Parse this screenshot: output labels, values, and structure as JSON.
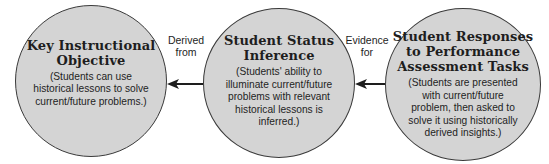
{
  "diagram": {
    "nodes": [
      {
        "id": "key-instructional-objective",
        "title": "Key Instructional Objective",
        "title_lines": [
          "Key Instructional",
          "Objective"
        ],
        "description_lines": [
          "(Students can use",
          "historical lessons to solve",
          "current/future problems.)"
        ]
      },
      {
        "id": "student-status-inference",
        "title": "Student Status Inference",
        "title_lines": [
          "Student Status",
          "Inference"
        ],
        "description_lines": [
          "(Students' ability to",
          "illuminate current/future",
          "problems with relevant",
          "historical lessons is",
          "inferred.)"
        ]
      },
      {
        "id": "student-responses",
        "title": "Student Responses to Performance Assessment Tasks",
        "title_lines": [
          "Student Responses",
          "to Performance",
          "Assessment Tasks"
        ],
        "description_lines": [
          "(Students are presented",
          "with current/future",
          "problem, then asked to",
          "solve it using historically",
          "derived insights.)"
        ]
      }
    ],
    "edges": [
      {
        "from": "student-status-inference",
        "to": "key-instructional-objective",
        "label_lines": [
          "Derived",
          "from"
        ]
      },
      {
        "from": "student-responses",
        "to": "student-status-inference",
        "label_lines": [
          "Evidence",
          "for"
        ]
      }
    ],
    "colors": {
      "circle_fill": "#d4d4d4",
      "circle_stroke": "#3a3a3a",
      "text": "#1e1e1e",
      "arrow": "#1e1e1e",
      "background": "#ffffff"
    }
  }
}
